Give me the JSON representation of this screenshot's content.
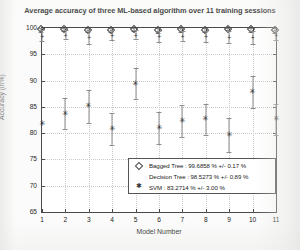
{
  "chart_data": {
    "type": "scatter",
    "title": "Average accuracy of three ML-based algorithm over 11 training sessions",
    "xlabel": "Model Number",
    "ylabel": "Accuracy (in%)",
    "categories": [
      1,
      2,
      3,
      4,
      5,
      6,
      7,
      8,
      9,
      10,
      11
    ],
    "xticks": [
      "1",
      "2",
      "3",
      "4",
      "5",
      "6",
      "7",
      "8",
      "9",
      "10",
      "11"
    ],
    "yticks": [
      "65",
      "70",
      "75",
      "80",
      "85",
      "90",
      "95",
      "100"
    ],
    "ylim": [
      65,
      100
    ],
    "xlim": [
      1,
      11
    ],
    "grid": true,
    "legend_position": "lower-right",
    "series": [
      {
        "name": "Bagged Tree",
        "marker": "diamond",
        "summary": "Bagged Tree : 99.6858 % +/- 0.17 %",
        "mean": 99.6858,
        "std": 0.17,
        "values": [
          99.75,
          99.8,
          99.7,
          99.68,
          99.85,
          99.6,
          99.72,
          99.66,
          99.9,
          99.75,
          99.62
        ],
        "errors": [
          0.45,
          0.4,
          0.55,
          0.42,
          0.38,
          0.5,
          0.45,
          0.48,
          0.35,
          0.42,
          0.5
        ]
      },
      {
        "name": "Decision Tree",
        "marker": "plus",
        "summary": "Decision Tree : 98.5273 % +/- 0.89 %",
        "mean": 98.5273,
        "std": 0.89,
        "values": [
          98.55,
          98.7,
          98.3,
          98.6,
          98.75,
          98.45,
          98.5,
          98.4,
          98.35,
          98.2,
          98.6
        ],
        "errors": [
          1.0,
          0.85,
          1.3,
          0.95,
          0.8,
          1.05,
          1.0,
          1.1,
          1.15,
          1.25,
          0.95
        ]
      },
      {
        "name": "SVM",
        "marker": "star",
        "summary": "SVM : 83.2714 % +/- 3.00 %",
        "mean": 83.2714,
        "std": 3.0,
        "values": [
          81.8,
          83.7,
          85.1,
          80.8,
          89.4,
          81.0,
          82.3,
          82.6,
          79.7,
          87.8,
          82.6
        ],
        "errors": [
          0.0,
          2.9,
          3.1,
          3.0,
          2.9,
          3.0,
          3.1,
          3.0,
          3.2,
          3.0,
          2.9
        ]
      }
    ]
  },
  "legend": {
    "entries": [
      {
        "symbol": "diamond",
        "label": "Bagged Tree : 99.6858 % +/- 0.17 %"
      },
      {
        "symbol": "none",
        "label": "Decision Tree : 98.5273 % +/- 0.89 %"
      },
      {
        "symbol": "star",
        "label": "SVM : 83.2714 % +/- 3.00 %"
      }
    ]
  }
}
